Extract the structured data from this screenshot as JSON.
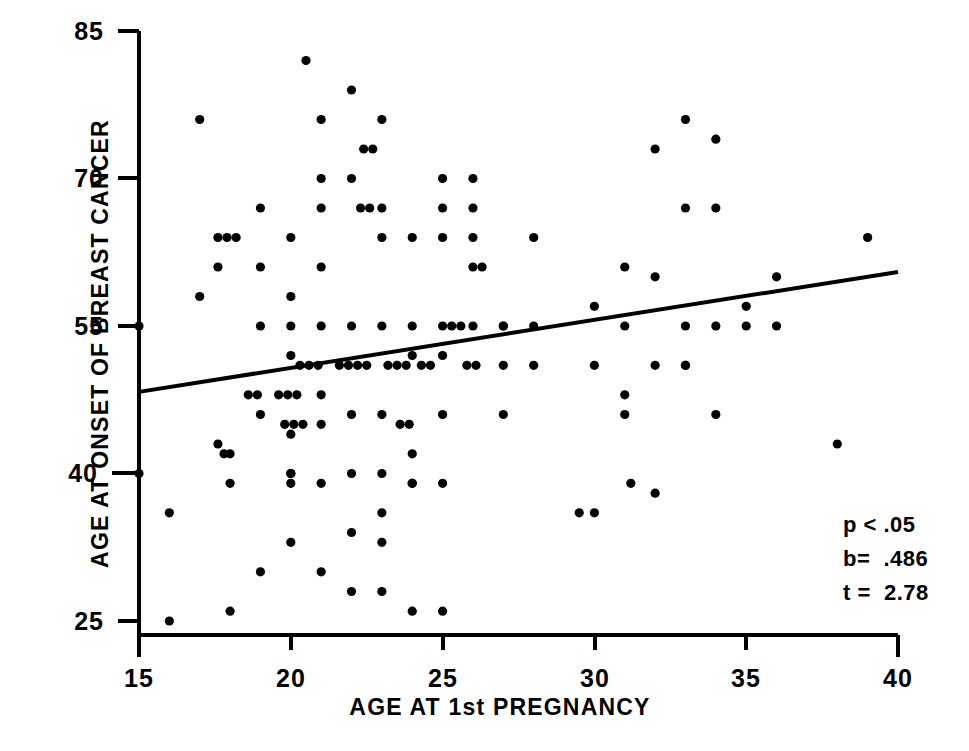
{
  "chart_data": {
    "type": "scatter",
    "title": "",
    "xlabel": "AGE AT 1st PREGNANCY",
    "ylabel": "AGE AT ONSET OF BREAST CANCER",
    "xlim": [
      15,
      40
    ],
    "ylim": [
      25,
      85
    ],
    "xticks": [
      15,
      20,
      25,
      30,
      35,
      40
    ],
    "yticks": [
      25,
      40,
      55,
      70,
      85
    ],
    "grid": false,
    "legend": null,
    "marker_color": "#000000",
    "axis_color": "#000000",
    "annotations": [
      {
        "name": "p-value",
        "text": "p < .05"
      },
      {
        "name": "slope",
        "text": "b=  .486"
      },
      {
        "name": "t-statistic",
        "text": "t =  2.78"
      }
    ],
    "trendline": {
      "type": "linear-regression",
      "x_start": 15,
      "y_start": 48.3,
      "x_end": 40,
      "y_end": 60.5,
      "slope": 0.486
    },
    "points": [
      [
        15.0,
        40.0
      ],
      [
        15.0,
        55.0
      ],
      [
        16.0,
        25.0
      ],
      [
        16.0,
        36.0
      ],
      [
        17.0,
        58.0
      ],
      [
        17.0,
        76.0
      ],
      [
        17.6,
        64.0
      ],
      [
        17.9,
        64.0
      ],
      [
        18.2,
        64.0
      ],
      [
        17.6,
        43.0
      ],
      [
        17.6,
        61.0
      ],
      [
        17.8,
        42.0
      ],
      [
        18.0,
        42.0
      ],
      [
        18.0,
        26.0
      ],
      [
        18.0,
        39.0
      ],
      [
        18.6,
        48.0
      ],
      [
        18.9,
        48.0
      ],
      [
        19.0,
        30.0
      ],
      [
        19.0,
        46.0
      ],
      [
        19.0,
        55.0
      ],
      [
        19.0,
        61.0
      ],
      [
        19.0,
        67.0
      ],
      [
        19.6,
        48.0
      ],
      [
        19.9,
        48.0
      ],
      [
        20.2,
        48.0
      ],
      [
        19.8,
        45.0
      ],
      [
        20.1,
        45.0
      ],
      [
        20.4,
        45.0
      ],
      [
        20.0,
        33.0
      ],
      [
        20.0,
        39.0
      ],
      [
        20.0,
        40.0
      ],
      [
        20.0,
        40.0
      ],
      [
        20.0,
        44.0
      ],
      [
        20.0,
        52.0
      ],
      [
        20.0,
        55.0
      ],
      [
        20.0,
        58.0
      ],
      [
        20.0,
        64.0
      ],
      [
        20.3,
        51.0
      ],
      [
        20.6,
        51.0
      ],
      [
        20.9,
        51.0
      ],
      [
        20.5,
        82.0
      ],
      [
        21.0,
        30.0
      ],
      [
        21.0,
        39.0
      ],
      [
        21.0,
        45.0
      ],
      [
        21.0,
        48.0
      ],
      [
        21.0,
        55.0
      ],
      [
        21.0,
        61.0
      ],
      [
        21.0,
        67.0
      ],
      [
        21.0,
        70.0
      ],
      [
        21.0,
        76.0
      ],
      [
        21.6,
        51.0
      ],
      [
        21.9,
        51.0
      ],
      [
        22.2,
        51.0
      ],
      [
        22.5,
        51.0
      ],
      [
        22.0,
        28.0
      ],
      [
        22.0,
        34.0
      ],
      [
        22.0,
        40.0
      ],
      [
        22.0,
        46.0
      ],
      [
        22.0,
        55.0
      ],
      [
        22.0,
        70.0
      ],
      [
        22.0,
        79.0
      ],
      [
        22.3,
        67.0
      ],
      [
        22.6,
        67.0
      ],
      [
        22.4,
        73.0
      ],
      [
        22.7,
        73.0
      ],
      [
        23.0,
        28.0
      ],
      [
        23.0,
        33.0
      ],
      [
        23.0,
        36.0
      ],
      [
        23.0,
        40.0
      ],
      [
        23.0,
        46.0
      ],
      [
        23.0,
        55.0
      ],
      [
        23.0,
        64.0
      ],
      [
        23.0,
        67.0
      ],
      [
        23.0,
        76.0
      ],
      [
        23.2,
        51.0
      ],
      [
        23.5,
        51.0
      ],
      [
        23.8,
        51.0
      ],
      [
        23.6,
        45.0
      ],
      [
        23.9,
        45.0
      ],
      [
        24.0,
        26.0
      ],
      [
        24.0,
        39.0
      ],
      [
        24.0,
        39.0
      ],
      [
        24.0,
        42.0
      ],
      [
        24.0,
        52.0
      ],
      [
        24.0,
        55.0
      ],
      [
        24.0,
        64.0
      ],
      [
        24.3,
        51.0
      ],
      [
        24.6,
        51.0
      ],
      [
        25.0,
        26.0
      ],
      [
        25.0,
        39.0
      ],
      [
        25.0,
        46.0
      ],
      [
        25.0,
        52.0
      ],
      [
        25.0,
        55.0
      ],
      [
        25.0,
        64.0
      ],
      [
        25.0,
        67.0
      ],
      [
        25.0,
        70.0
      ],
      [
        25.3,
        55.0
      ],
      [
        25.6,
        55.0
      ],
      [
        25.8,
        51.0
      ],
      [
        26.1,
        51.0
      ],
      [
        26.0,
        55.0
      ],
      [
        26.0,
        61.0
      ],
      [
        26.0,
        64.0
      ],
      [
        26.0,
        67.0
      ],
      [
        26.0,
        70.0
      ],
      [
        26.3,
        61.0
      ],
      [
        27.0,
        46.0
      ],
      [
        27.0,
        51.0
      ],
      [
        27.0,
        55.0
      ],
      [
        27.0,
        55.0
      ],
      [
        28.0,
        51.0
      ],
      [
        28.0,
        55.0
      ],
      [
        28.0,
        64.0
      ],
      [
        29.5,
        36.0
      ],
      [
        30.0,
        36.0
      ],
      [
        30.0,
        51.0
      ],
      [
        30.0,
        57.0
      ],
      [
        31.0,
        46.0
      ],
      [
        31.0,
        48.0
      ],
      [
        31.0,
        55.0
      ],
      [
        31.0,
        61.0
      ],
      [
        31.2,
        39.0
      ],
      [
        32.0,
        38.0
      ],
      [
        32.0,
        51.0
      ],
      [
        32.0,
        60.0
      ],
      [
        32.0,
        73.0
      ],
      [
        33.0,
        51.0
      ],
      [
        33.0,
        51.0
      ],
      [
        33.0,
        55.0
      ],
      [
        33.0,
        67.0
      ],
      [
        33.0,
        76.0
      ],
      [
        34.0,
        46.0
      ],
      [
        34.0,
        55.0
      ],
      [
        34.0,
        67.0
      ],
      [
        34.0,
        74.0
      ],
      [
        35.0,
        55.0
      ],
      [
        35.0,
        57.0
      ],
      [
        36.0,
        55.0
      ],
      [
        36.0,
        60.0
      ],
      [
        38.0,
        43.0
      ],
      [
        39.0,
        64.0
      ]
    ]
  },
  "axes": {
    "y_title": "AGE AT ONSET OF BREAST CANCER",
    "x_title": "AGE AT 1st PREGNANCY",
    "y_tick_labels": [
      "85",
      "70",
      "55",
      "40",
      "25"
    ],
    "x_tick_labels": [
      "15",
      "20",
      "25",
      "30",
      "35",
      "40"
    ]
  },
  "stats": {
    "p": "p < .05",
    "b": "b=  .486",
    "t": "t =  2.78"
  }
}
